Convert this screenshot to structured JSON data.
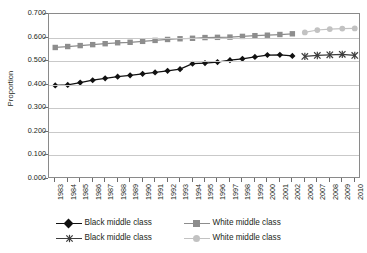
{
  "chart_data": {
    "type": "line",
    "title": "",
    "xlabel": "",
    "ylabel": "Proportion",
    "ylim": [
      0.0,
      0.7
    ],
    "ytick_labels": [
      "0.700",
      "0.600",
      "0.500",
      "0.400",
      "0.300",
      "0.200",
      "0.100",
      "0.000"
    ],
    "ytick_values": [
      0.7,
      0.6,
      0.5,
      0.4,
      0.3,
      0.2,
      0.1,
      0.0
    ],
    "grid": true,
    "legend_position": "bottom",
    "categories": [
      "1983",
      "1984",
      "1985",
      "1986",
      "1987",
      "1988",
      "1989",
      "1990",
      "1991",
      "1992",
      "1993",
      "1994",
      "1995",
      "1996",
      "1997",
      "1998",
      "1999",
      "2000",
      "2001",
      "2002",
      "2006",
      "2007",
      "2008",
      "2009",
      "2010"
    ],
    "note_gap_years": [
      "2003",
      "2004",
      "2005"
    ],
    "series": [
      {
        "name": "Black middle class",
        "marker": "diamond",
        "color": "#111111",
        "x": [
          "1983",
          "1984",
          "1985",
          "1986",
          "1987",
          "1988",
          "1989",
          "1990",
          "1991",
          "1992",
          "1993",
          "1994",
          "1995",
          "1996",
          "1997",
          "1998",
          "1999",
          "2000",
          "2001",
          "2002"
        ],
        "values": [
          0.397,
          0.399,
          0.409,
          0.419,
          0.427,
          0.434,
          0.44,
          0.446,
          0.452,
          0.459,
          0.466,
          0.489,
          0.492,
          0.496,
          0.504,
          0.51,
          0.518,
          0.526,
          0.527,
          0.522
        ]
      },
      {
        "name": "White middle class",
        "marker": "square",
        "color": "#8d8d8d",
        "x": [
          "1983",
          "1984",
          "1985",
          "1986",
          "1987",
          "1988",
          "1989",
          "1990",
          "1991",
          "1992",
          "1993",
          "1994",
          "1995",
          "1996",
          "1997",
          "1998",
          "1999",
          "2000",
          "2001",
          "2002"
        ],
        "values": [
          0.558,
          0.562,
          0.566,
          0.57,
          0.574,
          0.578,
          0.58,
          0.584,
          0.588,
          0.592,
          0.595,
          0.597,
          0.6,
          0.601,
          0.602,
          0.605,
          0.608,
          0.61,
          0.613,
          0.616
        ]
      },
      {
        "name": "Black middle class",
        "marker": "x",
        "color": "#3d3d3d",
        "x": [
          "2006",
          "2007",
          "2008",
          "2009",
          "2010"
        ],
        "values": [
          0.52,
          0.524,
          0.527,
          0.529,
          0.524
        ]
      },
      {
        "name": "White middle class",
        "marker": "circle",
        "color": "#c2c2c2",
        "x": [
          "2006",
          "2007",
          "2008",
          "2009",
          "2010"
        ],
        "values": [
          0.622,
          0.632,
          0.636,
          0.638,
          0.639
        ]
      }
    ]
  },
  "legend": {
    "items": [
      {
        "label": "Black middle class",
        "marker": "diamond",
        "color": "#111111"
      },
      {
        "label": "White middle class",
        "marker": "square",
        "color": "#8d8d8d"
      },
      {
        "label": "Black middle class",
        "marker": "x",
        "color": "#3d3d3d"
      },
      {
        "label": "White middle class",
        "marker": "circle",
        "color": "#c2c2c2"
      }
    ]
  }
}
